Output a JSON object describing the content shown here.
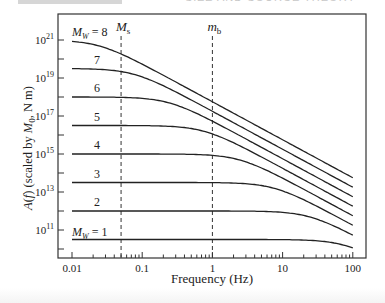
{
  "header": {
    "partial_title": "SIZE AND SOURCE THEORY"
  },
  "chart_data": {
    "type": "line",
    "title": "",
    "xlabel": "Frequency (Hz)",
    "ylabel": "A(f) (scaled by M0, N m)",
    "xscale": "log",
    "yscale": "log",
    "xlim": [
      0.01,
      100
    ],
    "x_ticks": [
      "0.01",
      "0.1",
      "1",
      "10",
      "100"
    ],
    "y_ticks": [
      "10^11",
      "10^13",
      "10^15",
      "10^17",
      "10^19",
      "10^21"
    ],
    "model": "omega-squared source spectrum A(f) = M0 / (1 + (f/fc)^2)",
    "series": [
      {
        "name": "Mw = 1",
        "label": "M_W = 1",
        "log10_M0": 10.5,
        "fc_hz": 75
      },
      {
        "name": "Mw = 2",
        "label": "2",
        "log10_M0": 12.0,
        "fc_hz": 23.7
      },
      {
        "name": "Mw = 3",
        "label": "3",
        "log10_M0": 13.5,
        "fc_hz": 7.5
      },
      {
        "name": "Mw = 4",
        "label": "4",
        "log10_M0": 15.0,
        "fc_hz": 2.37
      },
      {
        "name": "Mw = 5",
        "label": "5",
        "log10_M0": 16.5,
        "fc_hz": 0.75
      },
      {
        "name": "Mw = 6",
        "label": "6",
        "log10_M0": 18.0,
        "fc_hz": 0.237
      },
      {
        "name": "Mw = 7",
        "label": "7",
        "log10_M0": 19.5,
        "fc_hz": 0.075
      },
      {
        "name": "Mw = 8",
        "label": "M_W = 8",
        "log10_M0": 21.0,
        "fc_hz": 0.0237
      }
    ],
    "vertical_lines": [
      {
        "label": "Ms",
        "x": 0.05,
        "style": "dashed"
      },
      {
        "label": "mb",
        "x": 1,
        "style": "dashed"
      }
    ],
    "grid": false,
    "legend": "inline labels"
  }
}
